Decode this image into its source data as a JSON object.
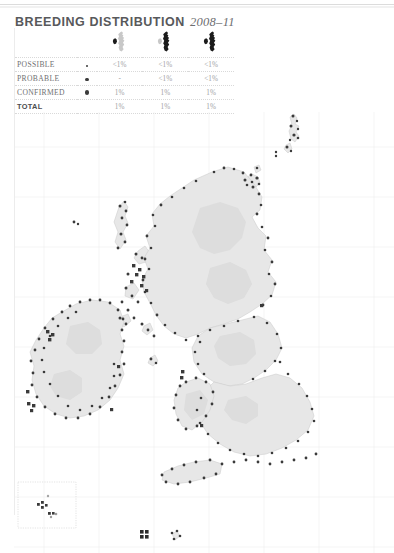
{
  "page": {
    "title_main": "BREEDING DISTRIBUTION",
    "title_years": "2008–11",
    "background_color": "#ffffff",
    "rule_color": "#ececec"
  },
  "legend_table": {
    "column_headers": [
      {
        "id": "category",
        "label": ""
      },
      {
        "id": "marker",
        "label": ""
      },
      {
        "id": "britain",
        "icon": "map-thumbnail-britain-ireland-1"
      },
      {
        "id": "britain_only",
        "icon": "map-thumbnail-britain-ireland-2"
      },
      {
        "id": "all",
        "icon": "map-thumbnail-britain-ireland-3"
      }
    ],
    "rows": [
      {
        "category": "POSSIBLE",
        "marker": "small-dot",
        "values": [
          "<1%",
          "<1%",
          "<1%"
        ]
      },
      {
        "category": "PROBABLE",
        "marker": "medium-dot",
        "values": [
          "-",
          "<1%",
          "<1%"
        ]
      },
      {
        "category": "CONFIRMED",
        "marker": "large-dot",
        "values": [
          "1%",
          "1%",
          "1%"
        ]
      },
      {
        "category": "TOTAL",
        "marker": "none",
        "values": [
          "1%",
          "1%",
          "1%"
        ]
      }
    ]
  },
  "map": {
    "name": "breeding-distribution-map-britain-ireland",
    "land_fill": "#e8e8e8",
    "coast_stroke": "#c9c9c9",
    "grid_stroke": "#ededed",
    "dot_color": "#333333",
    "regions": [
      "Shetland",
      "Orkney",
      "Scotland",
      "Ireland",
      "Wales",
      "England",
      "Channel Islands"
    ]
  },
  "inset": {
    "name": "channel-islands-inset",
    "border_color": "#dddddd"
  },
  "colors": {
    "title": "#58595b",
    "text": "#6f7072",
    "value_text": "#a2a3a5",
    "dot": "#3b3b3b"
  }
}
